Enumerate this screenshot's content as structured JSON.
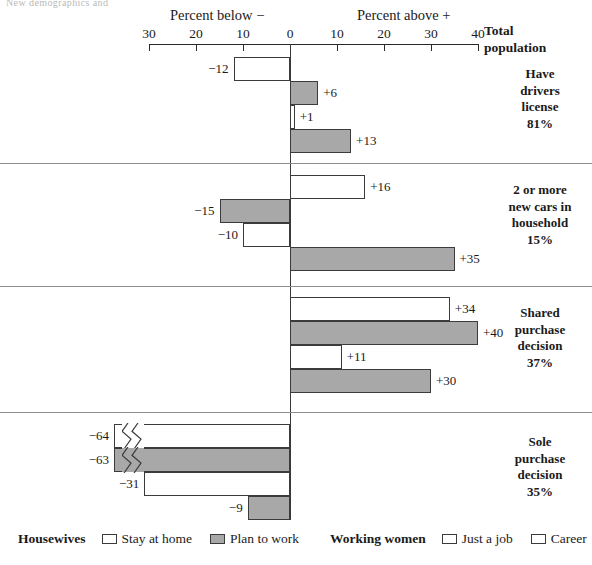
{
  "crop_header_text": "New demographics and",
  "axis": {
    "caption_below": "Percent below −",
    "caption_above": "Percent above +",
    "ticks": [
      {
        "label": "30",
        "value": -30
      },
      {
        "label": "20",
        "value": -20
      },
      {
        "label": "10",
        "value": -10
      },
      {
        "label": "0",
        "value": 0
      },
      {
        "label": "10",
        "value": 10
      },
      {
        "label": "20",
        "value": 20
      },
      {
        "label": "30",
        "value": 30
      },
      {
        "label": "40",
        "value": 40
      }
    ],
    "corner_label_line1": "Total",
    "corner_label_line2": "population"
  },
  "legend": {
    "housewives_title": "Housewives",
    "housewives_items": [
      {
        "label": "Stay at home",
        "fill": "white"
      },
      {
        "label": "Plan to work",
        "fill": "gray"
      }
    ],
    "working_title": "Working women",
    "working_items": [
      {
        "label": "Just a job",
        "fill": "white"
      },
      {
        "label": "Career",
        "fill": "white"
      }
    ]
  },
  "groups": [
    {
      "caption_lines": [
        "Have",
        "drivers",
        "license",
        "81%"
      ],
      "bars": [
        {
          "label": "−12",
          "value": -12,
          "fill": "white",
          "broken": false
        },
        {
          "label": "+6",
          "value": 6,
          "fill": "gray",
          "broken": false
        },
        {
          "label": "+1",
          "value": 1,
          "fill": "white",
          "broken": false
        },
        {
          "label": "+13",
          "value": 13,
          "fill": "gray",
          "broken": false
        }
      ]
    },
    {
      "caption_lines": [
        "2 or more",
        "new cars in",
        "household",
        "15%"
      ],
      "bars": [
        {
          "label": "+16",
          "value": 16,
          "fill": "white",
          "broken": false
        },
        {
          "label": "−15",
          "value": -15,
          "fill": "gray",
          "broken": false
        },
        {
          "label": "−10",
          "value": -10,
          "fill": "white",
          "broken": false
        },
        {
          "label": "+35",
          "value": 35,
          "fill": "gray",
          "broken": false
        }
      ]
    },
    {
      "caption_lines": [
        "Shared",
        "purchase",
        "decision",
        "37%"
      ],
      "bars": [
        {
          "label": "+34",
          "value": 34,
          "fill": "white",
          "broken": false
        },
        {
          "label": "+40",
          "value": 40,
          "fill": "gray",
          "broken": false
        },
        {
          "label": "+11",
          "value": 11,
          "fill": "white",
          "broken": false
        },
        {
          "label": "+30",
          "value": 30,
          "fill": "gray",
          "broken": false
        }
      ]
    },
    {
      "caption_lines": [
        "Sole",
        "purchase",
        "decision",
        "35%"
      ],
      "bars": [
        {
          "label": "−64",
          "value": -64,
          "fill": "white",
          "broken": true
        },
        {
          "label": "−63",
          "value": -63,
          "fill": "gray",
          "broken": true
        },
        {
          "label": "−31",
          "value": -31,
          "fill": "white",
          "broken": false
        },
        {
          "label": "−9",
          "value": -9,
          "fill": "gray",
          "broken": false
        }
      ]
    }
  ],
  "chart_data": {
    "type": "bar",
    "title": "",
    "subtitle": "",
    "orientation": "horizontal",
    "xlabel_left": "Percent below −",
    "xlabel_right": "Percent above +",
    "ylabel": "",
    "xlim": [
      -30,
      40
    ],
    "xticks": [
      -30,
      -20,
      -10,
      0,
      10,
      20,
      30,
      40
    ],
    "xticklabels": [
      "30",
      "20",
      "10",
      "0",
      "10",
      "20",
      "30",
      "40"
    ],
    "grid": false,
    "legend_position": "bottom",
    "note": "Axis is broken for bars exceeding −30; values −64 and −63 are drawn truncated with a zigzag break.",
    "series": [
      {
        "name": "Stay at home",
        "fill": "white",
        "group": "Housewives",
        "values": [
          -12,
          16,
          34,
          -64
        ]
      },
      {
        "name": "Plan to work",
        "fill": "gray",
        "group": "Housewives",
        "values": [
          6,
          -15,
          40,
          -63
        ]
      },
      {
        "name": "Just a job",
        "fill": "white",
        "group": "Working women",
        "values": [
          1,
          -10,
          11,
          -31
        ]
      },
      {
        "name": "Career",
        "fill": "white",
        "group": "Working women",
        "values": [
          13,
          35,
          30,
          -9
        ]
      }
    ],
    "categories": [
      "Have drivers license 81%",
      "2 or more new cars in household 15%",
      "Shared purchase decision 37%",
      "Sole purchase decision 35%"
    ],
    "category_totals": [
      "81%",
      "15%",
      "37%",
      "35%"
    ],
    "data_labels": [
      [
        "−12",
        "+6",
        "+1",
        "+13"
      ],
      [
        "+16",
        "−15",
        "−10",
        "+35"
      ],
      [
        "+34",
        "+40",
        "+11",
        "+30"
      ],
      [
        "−64",
        "−63",
        "−31",
        "−9"
      ]
    ],
    "colors": {
      "white_fill": "#ffffff",
      "gray_fill": "#a8a8a8",
      "stroke": "#3b3b3b"
    }
  }
}
